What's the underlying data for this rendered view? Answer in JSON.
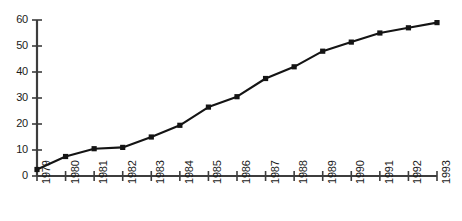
{
  "chart_data": {
    "type": "line",
    "title": "",
    "subtitle": "",
    "xlabel": "",
    "ylabel": "",
    "categories": [
      "1979",
      "1980",
      "1981",
      "1982",
      "1983",
      "1984",
      "1985",
      "1986",
      "1987",
      "1988",
      "1989",
      "1990",
      "1991",
      "1992",
      "1993"
    ],
    "values": [
      2.5,
      7.5,
      10.5,
      11,
      15,
      19.5,
      26.5,
      30.5,
      37.5,
      42,
      48,
      51.5,
      55,
      57,
      59
    ],
    "series": [
      {
        "name": "series-1",
        "values": [
          2.5,
          7.5,
          10.5,
          11,
          15,
          19.5,
          26.5,
          30.5,
          37.5,
          42,
          48,
          51.5,
          55,
          57,
          59
        ]
      }
    ],
    "ylim": [
      0,
      60
    ],
    "ytick_labels": [
      "0",
      "10",
      "20",
      "30",
      "40",
      "50",
      "60"
    ],
    "ytick_values": [
      0,
      10,
      20,
      30,
      40,
      50,
      60
    ],
    "xtick_labels": [
      "1979",
      "1980",
      "1981",
      "1982",
      "1983",
      "1984",
      "1985",
      "1986",
      "1987",
      "1988",
      "1989",
      "1990",
      "1991",
      "1992",
      "1993"
    ],
    "grid": false,
    "legend": false,
    "legend_position": "none",
    "marker": "square",
    "line_color": "#141414",
    "marker_color": "#141414",
    "axis_color": "#3d3d3d",
    "background_color": "#ffffff",
    "annotations": []
  }
}
